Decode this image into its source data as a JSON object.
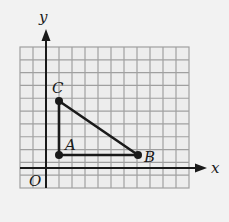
{
  "diagram": {
    "type": "coordinate-grid-triangle",
    "grid": {
      "columns": 13,
      "rows": 11,
      "line_color": "#9a9a9a",
      "background": "#ececec"
    },
    "axes": {
      "x_label": "x",
      "y_label": "y",
      "origin_label": "O"
    },
    "points": [
      {
        "label": "A",
        "grid_x": 1,
        "grid_y": 1
      },
      {
        "label": "B",
        "grid_x": 7,
        "grid_y": 1
      },
      {
        "label": "C",
        "grid_x": 1,
        "grid_y": 5
      }
    ],
    "segments": [
      "AB",
      "AC",
      "BC"
    ],
    "colors": {
      "ink": "#1a1a1a",
      "grid": "#9a9a9a"
    }
  }
}
